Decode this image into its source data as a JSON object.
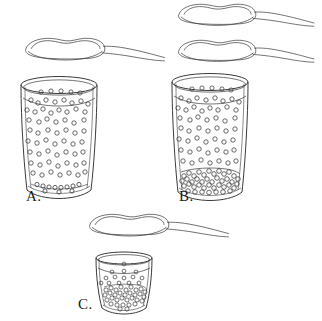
{
  "figure": {
    "type": "line-drawing-diagram",
    "background_color": "#ffffff",
    "stroke_color": "#3a3a3a",
    "particle_fill": "#ffffff"
  },
  "panels": [
    {
      "id": "A",
      "label": "A.",
      "label_position": {
        "x": 26,
        "y": 188
      },
      "spoons": 1,
      "spoon_contents": "heaped powder",
      "glass": {
        "shape": "straight-sided tumbler",
        "x": 21,
        "y": 78,
        "width": 76,
        "height": 120,
        "liquid_level_y": 98
      },
      "suspended_particles": 96,
      "sediment_layer": "thin single layer of particles on the bottom",
      "sediment_height_px": 7,
      "state": "almost all solute dissolved"
    },
    {
      "id": "B",
      "label": "B.",
      "label_position": {
        "x": 179,
        "y": 188
      },
      "spoons": 2,
      "spoon_contents": "heaped powder",
      "glass": {
        "shape": "straight-sided tumbler",
        "x": 172,
        "y": 75,
        "width": 76,
        "height": 124,
        "liquid_level_y": 96
      },
      "suspended_particles": 92,
      "sediment_layer": "thick dense packed layer of particles on the bottom",
      "sediment_height_px": 24,
      "state": "saturated, excess solute settled"
    },
    {
      "id": "C",
      "label": "C.",
      "label_position": {
        "x": 78,
        "y": 296
      },
      "spoons": 1,
      "spoon_contents": "heaped powder",
      "glass": {
        "shape": "small tapered tumbler",
        "x": 96,
        "y": 253,
        "width": 56,
        "height": 60,
        "liquid_level_y": 268
      },
      "suspended_particles": 14,
      "sediment_layer": "dense packed particles filling lower half",
      "sediment_height_px": 27,
      "state": "small volume, mostly undissolved solute"
    }
  ],
  "legend_labels": [
    "A.",
    "B.",
    "C."
  ]
}
